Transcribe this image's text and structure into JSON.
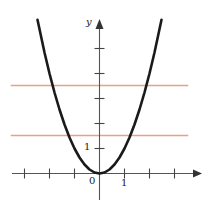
{
  "figure": {
    "background": "#ffffff",
    "width": 213,
    "height": 218,
    "axis_color": "#555555",
    "curve_color": "#1a1a1a",
    "hline_color": "#e8a183"
  },
  "labels": {
    "y_axis_name": "y",
    "x_axis_name": "",
    "origin": "0",
    "x_tick_one": "1",
    "y_tick_one": "1"
  },
  "chart_data": {
    "type": "line",
    "title": "",
    "xlabel": "",
    "ylabel": "y",
    "grid": false,
    "legend": "none",
    "xlim": [
      -3.6,
      3.6
    ],
    "ylim": [
      -0.9,
      6.6
    ],
    "xticks": [
      -3,
      -2,
      -1,
      0,
      1,
      2,
      3
    ],
    "yticks": [
      1,
      2,
      3,
      4,
      5
    ],
    "xtick_labels": [
      "",
      "",
      "",
      "0",
      "1",
      "",
      ""
    ],
    "ytick_labels": [
      "1",
      "",
      "",
      "",
      ""
    ],
    "series": [
      {
        "name": "parabola",
        "type": "line",
        "color": "#1a1a1a",
        "equation": "y = x^2",
        "x": [
          -2.48,
          -2.2,
          -2.0,
          -1.8,
          -1.6,
          -1.4,
          -1.2,
          -1.0,
          -0.8,
          -0.6,
          -0.4,
          -0.2,
          0.0,
          0.2,
          0.4,
          0.6,
          0.8,
          1.0,
          1.2,
          1.4,
          1.6,
          1.8,
          2.0,
          2.2,
          2.48
        ],
        "y": [
          6.15,
          4.84,
          4.0,
          3.24,
          2.56,
          1.96,
          1.44,
          1.0,
          0.64,
          0.36,
          0.16,
          0.04,
          0.0,
          0.04,
          0.16,
          0.36,
          0.64,
          1.0,
          1.44,
          1.96,
          2.56,
          3.24,
          4.0,
          4.84,
          6.15
        ]
      },
      {
        "name": "upper-horizontal-line",
        "type": "hline",
        "color": "#e8a183",
        "y": 3.52,
        "x_start": -3.55,
        "x_end": 3.55
      },
      {
        "name": "lower-horizontal-line",
        "type": "hline",
        "color": "#e8a183",
        "y": 1.52,
        "x_start": -3.55,
        "x_end": 3.55
      }
    ]
  }
}
